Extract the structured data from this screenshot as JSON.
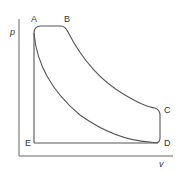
{
  "diagram": {
    "type": "p-v diagram",
    "axes": {
      "y_label": "p",
      "x_label": "v"
    },
    "points": [
      {
        "id": "A",
        "label": "A"
      },
      {
        "id": "B",
        "label": "B"
      },
      {
        "id": "C",
        "label": "C"
      },
      {
        "id": "D",
        "label": "D"
      },
      {
        "id": "E",
        "label": "E"
      }
    ],
    "colors": {
      "line": "#555555",
      "text": "#333333"
    }
  }
}
